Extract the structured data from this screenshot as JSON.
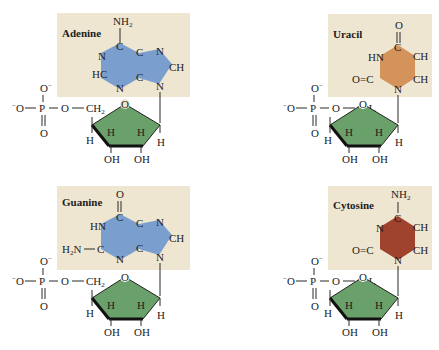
{
  "figure": {
    "colors": {
      "background": "#ffffff",
      "base_box": "#efe6d2",
      "purine_fill": "#7a9fce",
      "uracil_fill": "#d4935a",
      "cytosine_fill": "#a0432e",
      "sugar_fill": "#6aa06a",
      "text": "#1d1d1d"
    },
    "nucleotides": [
      {
        "name": "Adenine",
        "type": "purine",
        "substituents": {
          "top": "NH2",
          "left_upper": "N",
          "left_lower": "HC",
          "bottom": "N",
          "ring2_top": "N",
          "ring2_right": "CH",
          "ring2_bottom": "N",
          "c_top": "C",
          "c_mid_top": "C",
          "c_mid_bottom": "C"
        }
      },
      {
        "name": "Uracil",
        "type": "pyrimidine",
        "substituents": {
          "top": "O",
          "left_upper": "HN",
          "left_lower": "O=C",
          "right_upper": "CH",
          "right_lower": "CH",
          "bottom": "N",
          "c_top": "C"
        }
      },
      {
        "name": "Guanine",
        "type": "purine",
        "substituents": {
          "top": "O",
          "left_upper": "HN",
          "left_lower": "H2N—C",
          "bottom": "N",
          "ring2_top": "N",
          "ring2_right": "CH",
          "ring2_bottom": "N",
          "c_top": "C",
          "c_mid_top": "C",
          "c_mid_bottom": "C"
        }
      },
      {
        "name": "Cytosine",
        "type": "pyrimidine",
        "substituents": {
          "top": "NH2",
          "left_upper": "N",
          "left_lower": "O=C",
          "right_upper": "CH",
          "right_lower": "CH",
          "bottom": "N",
          "c_top": "C"
        }
      }
    ],
    "phosphate": {
      "o_top": "O⁻",
      "o_left": "⁻O",
      "p": "P",
      "o_link": "O",
      "o_bottom": "O",
      "ch2": "CH",
      "ch2_sub": "2"
    },
    "sugar": {
      "ring_o": "O",
      "h_left": "H",
      "h_in1": "H",
      "h_in2": "H",
      "h_right": "H",
      "oh1": "OH",
      "oh2": "OH"
    }
  }
}
